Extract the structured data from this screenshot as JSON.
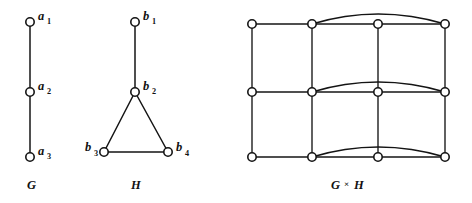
{
  "figure": {
    "background_color": "#ffffff",
    "ink_color": "#141414",
    "panels": [
      {
        "id": "panel-g",
        "caption": "G",
        "caption_x": 27,
        "caption_y": 189,
        "nodes": [
          {
            "id": "a1",
            "base": "a",
            "sub": "1",
            "cx": 30,
            "cy": 22,
            "label_x": 38,
            "label_y": 20,
            "sub_x": 47,
            "sub_y": 24
          },
          {
            "id": "a2",
            "base": "a",
            "sub": "2",
            "cx": 30,
            "cy": 92,
            "label_x": 38,
            "label_y": 90,
            "sub_x": 47,
            "sub_y": 94
          },
          {
            "id": "a3",
            "base": "a",
            "sub": "3",
            "cx": 30,
            "cy": 157,
            "label_x": 38,
            "label_y": 155,
            "sub_x": 47,
            "sub_y": 159
          }
        ],
        "edges": [
          {
            "from": "a1",
            "to": "a2",
            "x1": 30,
            "y1": 22,
            "x2": 30,
            "y2": 92
          },
          {
            "from": "a2",
            "to": "a3",
            "x1": 30,
            "y1": 92,
            "x2": 30,
            "y2": 157
          }
        ]
      },
      {
        "id": "panel-h",
        "caption": "H",
        "caption_x": 131,
        "caption_y": 189,
        "nodes": [
          {
            "id": "b1",
            "base": "b",
            "sub": "1",
            "cx": 135,
            "cy": 22,
            "label_x": 143,
            "label_y": 20,
            "sub_x": 152,
            "sub_y": 24
          },
          {
            "id": "b2",
            "base": "b",
            "sub": "2",
            "cx": 135,
            "cy": 92,
            "label_x": 143,
            "label_y": 90,
            "sub_x": 152,
            "sub_y": 94
          },
          {
            "id": "b3",
            "base": "b",
            "sub": "3",
            "cx": 104,
            "cy": 152,
            "label_x": 85,
            "label_y": 151,
            "sub_x": 94,
            "sub_y": 156
          },
          {
            "id": "b4",
            "base": "b",
            "sub": "4",
            "cx": 168,
            "cy": 152,
            "label_x": 176,
            "label_y": 151,
            "sub_x": 185,
            "sub_y": 156
          }
        ],
        "edges": [
          {
            "from": "b1",
            "to": "b2",
            "x1": 135,
            "y1": 22,
            "x2": 135,
            "y2": 92
          },
          {
            "from": "b2",
            "to": "b3",
            "x1": 135,
            "y1": 92,
            "x2": 104,
            "y2": 152
          },
          {
            "from": "b2",
            "to": "b4",
            "x1": 135,
            "y1": 92,
            "x2": 168,
            "y2": 152
          },
          {
            "from": "b3",
            "to": "b4",
            "x1": 104,
            "y1": 152,
            "x2": 168,
            "y2": 152
          }
        ]
      },
      {
        "id": "panel-gxh",
        "caption": "G",
        "caption_operator": "×",
        "caption_second": "H",
        "caption_x": 331,
        "caption_y": 189,
        "caption_operator_x": 344,
        "caption_second_x": 354,
        "columns_x": [
          252,
          312,
          378,
          445
        ],
        "rows_y": [
          24,
          92,
          157
        ],
        "nodes": [
          {
            "id": "a1b1",
            "cx": 252,
            "cy": 24
          },
          {
            "id": "a1b2",
            "cx": 312,
            "cy": 24
          },
          {
            "id": "a1b3",
            "cx": 378,
            "cy": 24
          },
          {
            "id": "a1b4",
            "cx": 445,
            "cy": 24
          },
          {
            "id": "a2b1",
            "cx": 252,
            "cy": 92
          },
          {
            "id": "a2b2",
            "cx": 312,
            "cy": 92
          },
          {
            "id": "a2b3",
            "cx": 378,
            "cy": 92
          },
          {
            "id": "a2b4",
            "cx": 445,
            "cy": 92
          },
          {
            "id": "a3b1",
            "cx": 252,
            "cy": 157
          },
          {
            "id": "a3b2",
            "cx": 312,
            "cy": 157
          },
          {
            "id": "a3b3",
            "cx": 378,
            "cy": 157
          },
          {
            "id": "a3b4",
            "cx": 445,
            "cy": 157
          }
        ],
        "straight_edges": [
          {
            "from": "a1b1",
            "to": "a1b2",
            "x1": 252,
            "y1": 24,
            "x2": 312,
            "y2": 24
          },
          {
            "from": "a1b2",
            "to": "a1b3",
            "x1": 312,
            "y1": 24,
            "x2": 378,
            "y2": 24
          },
          {
            "from": "a1b3",
            "to": "a1b4",
            "x1": 378,
            "y1": 24,
            "x2": 445,
            "y2": 24
          },
          {
            "from": "a2b1",
            "to": "a2b2",
            "x1": 252,
            "y1": 92,
            "x2": 312,
            "y2": 92
          },
          {
            "from": "a2b2",
            "to": "a2b3",
            "x1": 312,
            "y1": 92,
            "x2": 378,
            "y2": 92
          },
          {
            "from": "a2b3",
            "to": "a2b4",
            "x1": 378,
            "y1": 92,
            "x2": 445,
            "y2": 92
          },
          {
            "from": "a3b1",
            "to": "a3b2",
            "x1": 252,
            "y1": 157,
            "x2": 312,
            "y2": 157
          },
          {
            "from": "a3b2",
            "to": "a3b3",
            "x1": 312,
            "y1": 157,
            "x2": 378,
            "y2": 157
          },
          {
            "from": "a3b3",
            "to": "a3b4",
            "x1": 378,
            "y1": 157,
            "x2": 445,
            "y2": 157
          },
          {
            "from": "a1b1",
            "to": "a2b1",
            "x1": 252,
            "y1": 24,
            "x2": 252,
            "y2": 92
          },
          {
            "from": "a2b1",
            "to": "a3b1",
            "x1": 252,
            "y1": 92,
            "x2": 252,
            "y2": 157
          },
          {
            "from": "a1b2",
            "to": "a2b2",
            "x1": 312,
            "y1": 24,
            "x2": 312,
            "y2": 92
          },
          {
            "from": "a2b2",
            "to": "a3b2",
            "x1": 312,
            "y1": 92,
            "x2": 312,
            "y2": 157
          },
          {
            "from": "a1b3",
            "to": "a2b3",
            "x1": 378,
            "y1": 24,
            "x2": 378,
            "y2": 92
          },
          {
            "from": "a2b3",
            "to": "a3b3",
            "x1": 378,
            "y1": 92,
            "x2": 378,
            "y2": 157
          },
          {
            "from": "a1b4",
            "to": "a2b4",
            "x1": 445,
            "y1": 24,
            "x2": 445,
            "y2": 92
          },
          {
            "from": "a2b4",
            "to": "a3b4",
            "x1": 445,
            "y1": 92,
            "x2": 445,
            "y2": 157
          }
        ],
        "arc_edges": [
          {
            "from": "a1b2",
            "to": "a1b4",
            "path": "M 312 24 Q 378 4 445 24"
          },
          {
            "from": "a2b2",
            "to": "a2b4",
            "path": "M 312 92 Q 378 72 445 92"
          },
          {
            "from": "a3b2",
            "to": "a3b4",
            "path": "M 312 157 Q 378 137 445 157"
          }
        ]
      }
    ],
    "node_radius": 4.2
  }
}
